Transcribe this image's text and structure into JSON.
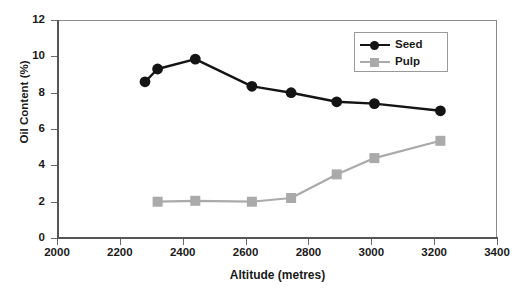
{
  "chart_data": {
    "type": "line",
    "title": "",
    "xlabel": "Altitude (metres)",
    "ylabel": "Oil Content (%)",
    "xlim": [
      2000,
      3400
    ],
    "ylim": [
      0,
      12
    ],
    "xticks": [
      2000,
      2200,
      2400,
      2600,
      2800,
      3000,
      3200,
      3400
    ],
    "yticks": [
      0,
      2,
      4,
      6,
      8,
      10,
      12
    ],
    "grid": false,
    "legend_position": "top-right",
    "series": [
      {
        "name": "Seed",
        "color": "#141414",
        "marker": "circle",
        "x": [
          2280,
          2320,
          2440,
          2620,
          2745,
          2890,
          3010,
          3220
        ],
        "y": [
          8.6,
          9.3,
          9.85,
          8.35,
          8.0,
          7.5,
          7.4,
          7.0
        ]
      },
      {
        "name": "Pulp",
        "color": "#aaaaaa",
        "marker": "square",
        "x": [
          2320,
          2440,
          2620,
          2745,
          2890,
          3010,
          3220
        ],
        "y": [
          2.0,
          2.05,
          2.0,
          2.2,
          3.5,
          4.4,
          5.35
        ]
      }
    ]
  },
  "axis": {
    "x_tick_labels": [
      "2000",
      "2200",
      "2400",
      "2600",
      "2800",
      "3000",
      "3200",
      "3400"
    ],
    "y_tick_labels": [
      "0",
      "2",
      "4",
      "6",
      "8",
      "10",
      "12"
    ],
    "x_title": "Altitude (metres)",
    "y_title": "Oil Content (%)"
  },
  "legend": {
    "entries": [
      {
        "label": "Seed",
        "color": "#141414",
        "marker": "circle-marker"
      },
      {
        "label": "Pulp",
        "color": "#aaaaaa",
        "marker": "square-marker"
      }
    ]
  }
}
